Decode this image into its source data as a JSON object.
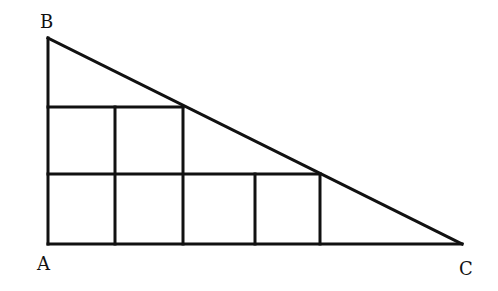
{
  "labels": {
    "B": "B",
    "A": "A",
    "C": "C"
  },
  "colors": {
    "stroke": "#111111",
    "background": "#ffffff"
  }
}
